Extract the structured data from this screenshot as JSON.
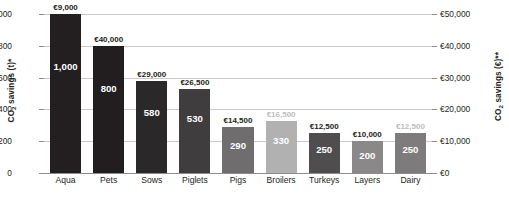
{
  "chart_data": {
    "type": "bar",
    "title": "",
    "subtitle": "",
    "xlabel": "",
    "ylabel": "CO2 savings (t)*",
    "ylabel_secondary": "CO2 savings (€)**",
    "grid": true,
    "legend": "none",
    "categories": [
      "Aqua",
      "Pets",
      "Sows",
      "Piglets",
      "Pigs",
      "Broilers",
      "Turkeys",
      "Layers",
      "Dairy"
    ],
    "values": [
      1000,
      800,
      580,
      530,
      290,
      330,
      250,
      200,
      250
    ],
    "value_labels": [
      "1,000",
      "800",
      "580",
      "530",
      "290",
      "330",
      "250",
      "200",
      "250"
    ],
    "top_labels": [
      "€9,000",
      "€40,000",
      "€29,000",
      "€26,500",
      "€14,500",
      "€16,500",
      "€12,500",
      "€10,000",
      "€12,500"
    ],
    "secondary_values": [
      9000,
      40000,
      29000,
      26500,
      14500,
      16500,
      12500,
      10000,
      12500
    ],
    "bar_colors": [
      "#231f20",
      "#221e1f",
      "#2b2829",
      "#403d3e",
      "#6f6d6e",
      "#b2b1b1",
      "#4f4d4e",
      "#8a8889",
      "#7d7b7c"
    ],
    "top_label_colors": [
      "#231f20",
      "#231f20",
      "#231f20",
      "#231f20",
      "#231f20",
      "#bdbdbd",
      "#231f20",
      "#231f20",
      "#bdbdbd"
    ],
    "ylim": [
      0,
      1000
    ],
    "ylim_secondary": [
      0,
      50000
    ],
    "yticks": [
      0,
      200,
      400,
      600,
      800,
      1000
    ],
    "ytick_labels": [
      "0",
      "200",
      "400",
      "600",
      "800",
      "1,000"
    ],
    "yticks_secondary": [
      0,
      10000,
      20000,
      30000,
      40000,
      50000
    ],
    "ytick_labels_secondary": [
      "€0",
      "€10,000",
      "€20,000",
      "€30,000",
      "€40,000",
      "€50,000"
    ]
  }
}
